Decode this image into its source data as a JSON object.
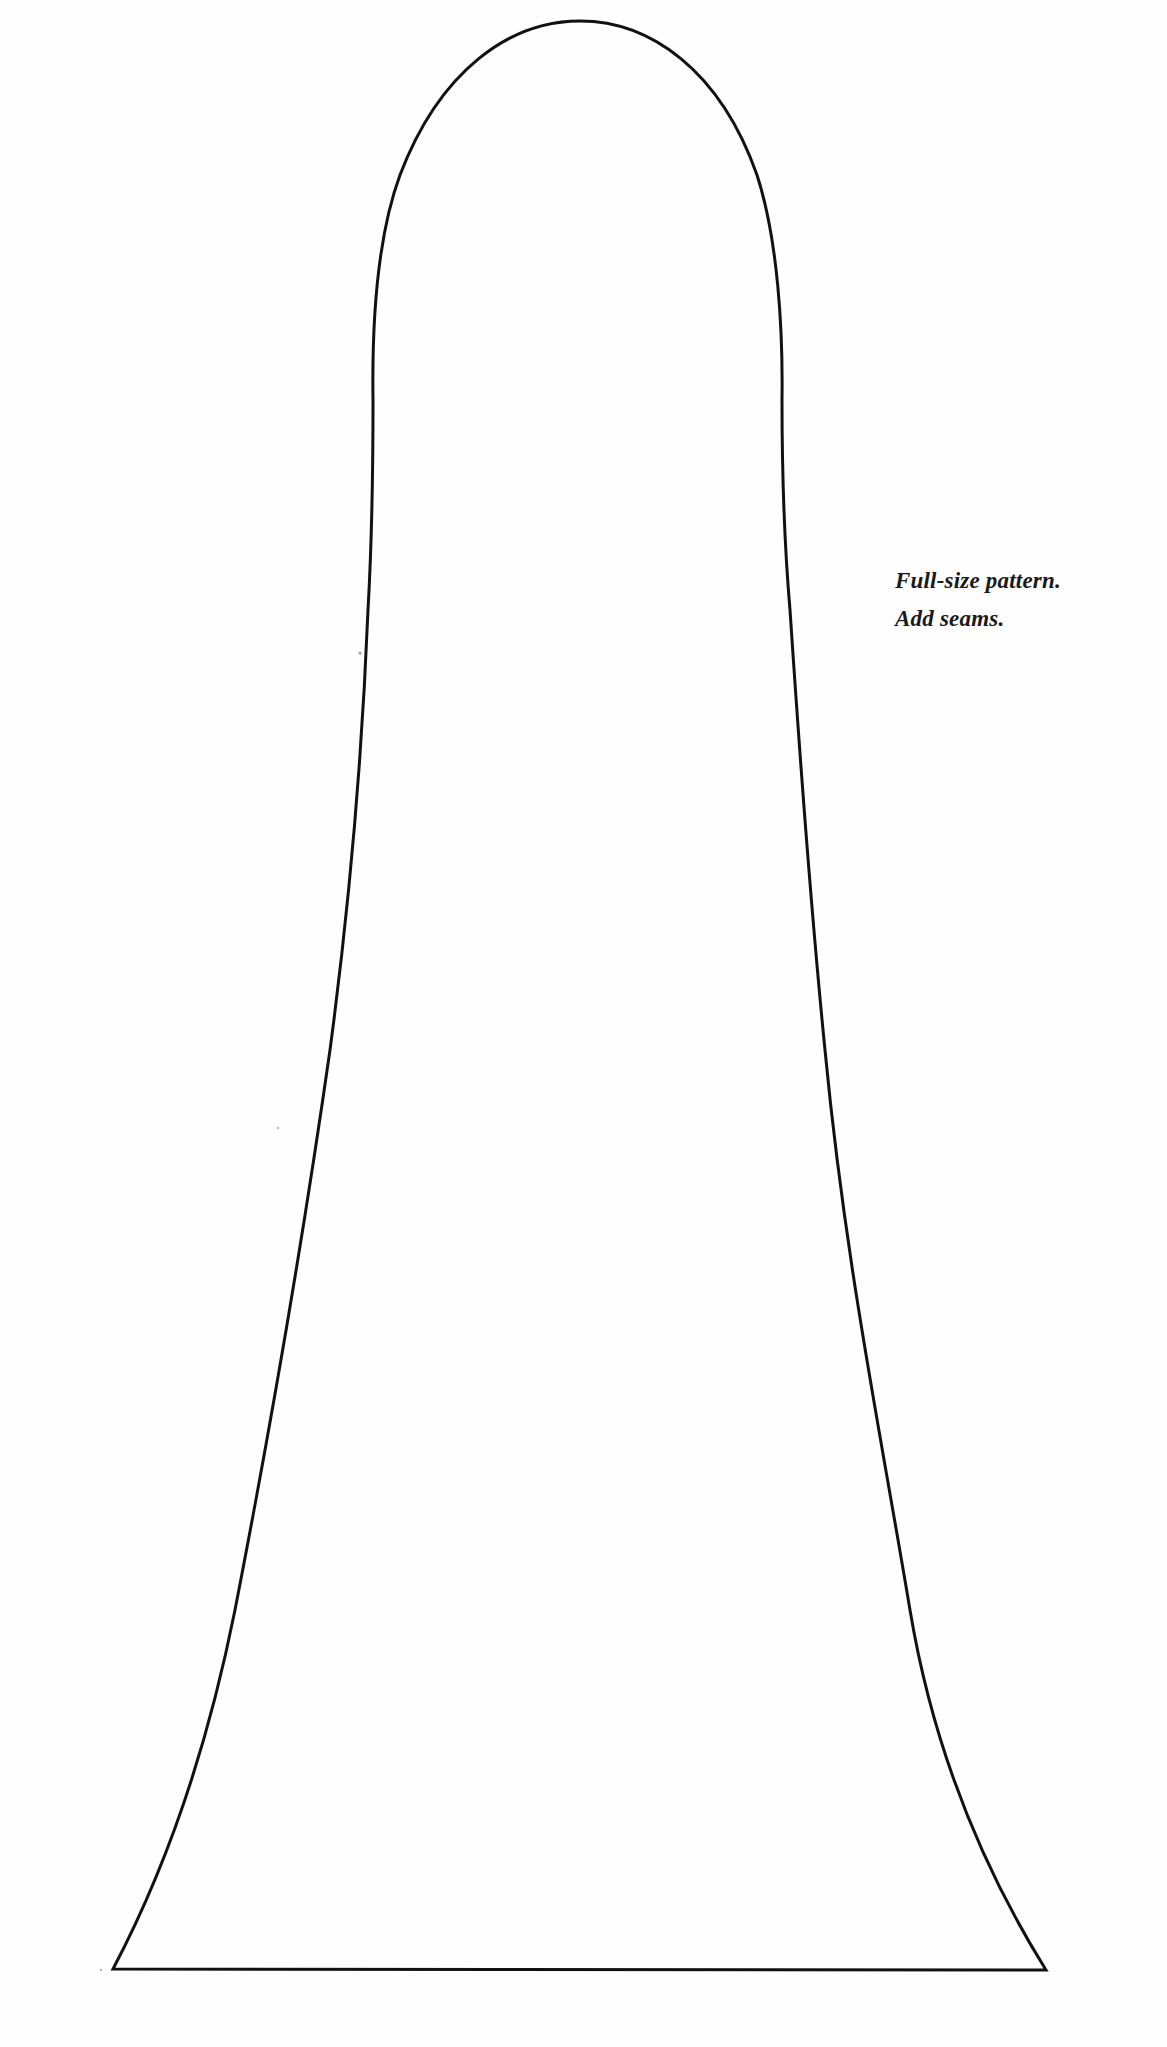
{
  "document": {
    "type": "sewing pattern page",
    "background_color": "#fefefe",
    "outline_color": "#111111"
  },
  "pattern": {
    "shape": "bell / elongated arch",
    "outline_path": "M 113 1969 C 160 1880, 205 1760, 235 1610 C 270 1430, 300 1260, 330 1050 C 350 900, 362 760, 368 610 C 372 540, 373 470, 373 400 C 372 330, 376 240, 400 175 C 440 70, 510 21, 580 21 C 650 21, 720 70, 757 175 C 778 240, 783 330, 782 400 C 782 470, 784 540, 790 610 C 800 760, 810 900, 825 1050 C 845 1260, 880 1430, 910 1610 C 935 1760, 990 1880, 1046 1970 Z",
    "bottom_left": [
      113,
      1969
    ],
    "bottom_right": [
      1046,
      1970
    ],
    "apex": [
      580,
      21
    ]
  },
  "note": {
    "line1": "Full-size pattern.",
    "line2": "Add seams."
  }
}
